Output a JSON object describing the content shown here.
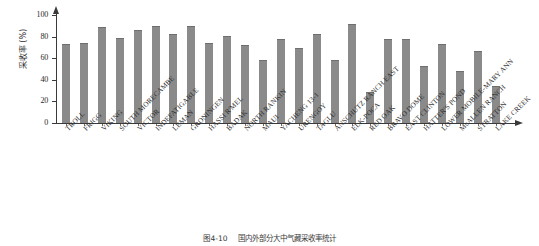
{
  "figure": {
    "caption_number": "图4-10",
    "caption_text": "国内外部分大中气藏采收率统计"
  },
  "chart_data": {
    "type": "bar",
    "title": "",
    "xlabel": "",
    "ylabel": "采收率 (%)",
    "ylim": [
      0,
      100
    ],
    "yticks": [
      0,
      20,
      40,
      60,
      80,
      100
    ],
    "ytick_labels": [
      "0",
      "20",
      "40",
      "60",
      "80",
      "100"
    ],
    "grid": false,
    "legend": null,
    "bar_color": "#8a8a8a",
    "axis_color": "#3a3a3a",
    "categories": [
      "TROLL",
      "FRIGG",
      "VIKING",
      "SOUTH MORECAMBE",
      "VICTOR",
      "INDEFATIGABLE",
      "LEMAN",
      "GRONINGEN",
      "HASSI R'MEL",
      "BADAK",
      "NORTH RANKIN",
      "MAUI",
      "YACHENG 13-1",
      "URENGOY",
      "TAGLU",
      "ANSCHUTZ RANCH EAST",
      "ELK-POCA",
      "RED OAK",
      "BRAVO DOME",
      "EAST CLINTON",
      "HATTER'S POND",
      "LOWER MOBILE-MARY ANN",
      "McALLEN RANCH",
      "STRATTON",
      "LAKE CREEK"
    ],
    "values": [
      73,
      74,
      89,
      79,
      86,
      90,
      82,
      90,
      74,
      81,
      72,
      58,
      78,
      69,
      82,
      58,
      92,
      29,
      78,
      78,
      53,
      73,
      48,
      67,
      34
    ]
  }
}
